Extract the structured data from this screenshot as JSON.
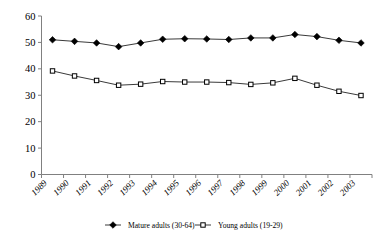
{
  "chart_data": {
    "type": "line",
    "title": "",
    "xlabel": "",
    "ylabel": "",
    "ylim": [
      0,
      60
    ],
    "yticks": [
      0,
      10,
      20,
      30,
      40,
      50,
      60
    ],
    "grid": false,
    "legend_position": "bottom",
    "categories": [
      "1989",
      "1990",
      "1991",
      "1992",
      "1993",
      "1994",
      "1995",
      "1996",
      "1997",
      "1998",
      "1999",
      "2000",
      "2001",
      "2002",
      "2003"
    ],
    "series": [
      {
        "name": "Mature adults (30-64)",
        "marker": "filled-diamond",
        "color": "#000000",
        "values": [
          51.0,
          50.4,
          49.8,
          48.4,
          49.8,
          51.2,
          51.4,
          51.3,
          51.1,
          51.7,
          51.7,
          53.0,
          52.2,
          50.8,
          49.8
        ]
      },
      {
        "name": "Young adults (19-29)",
        "marker": "open-square",
        "color": "#000000",
        "values": [
          39.2,
          37.3,
          35.6,
          33.8,
          34.2,
          35.2,
          35.0,
          35.0,
          34.8,
          34.1,
          34.7,
          36.4,
          33.8,
          31.5,
          29.9
        ]
      }
    ]
  },
  "legend": {
    "items": [
      {
        "label": "Mature adults (30-64)",
        "marker": "filled-diamond"
      },
      {
        "label": "Young adults (19-29)",
        "marker": "open-square"
      }
    ]
  },
  "axis": {
    "y_labels": [
      "60",
      "50",
      "40",
      "30",
      "20",
      "10",
      "0"
    ],
    "x_labels": [
      "1989",
      "1990",
      "1991",
      "1992",
      "1993",
      "1994",
      "1995",
      "1996",
      "1997",
      "1998",
      "1999",
      "2000",
      "2001",
      "2002",
      "2003"
    ]
  }
}
